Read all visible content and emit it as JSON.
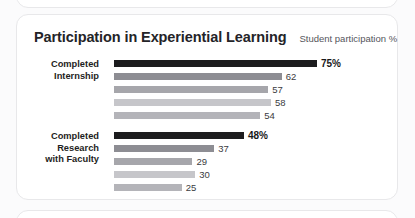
{
  "header": {
    "title": "Participation in Experiential Learning",
    "subtitle": "Student participation %"
  },
  "chart_data": {
    "type": "bar",
    "title": "Participation in Experiential Learning",
    "subtitle": "Student participation %",
    "orientation": "horizontal",
    "xlabel": "",
    "ylabel": "",
    "xlim": [
      0,
      80
    ],
    "grid": false,
    "legend": false,
    "value_unit": "%",
    "groups": [
      {
        "label_lines": [
          "Completed",
          "Internship"
        ],
        "bars": [
          {
            "value": 75,
            "label": "75%",
            "color": "#1c1c1e",
            "highlight": true
          },
          {
            "value": 62,
            "label": "62",
            "color": "#8d8d93",
            "highlight": false
          },
          {
            "value": 57,
            "label": "57",
            "color": "#a6a6ab",
            "highlight": false
          },
          {
            "value": 58,
            "label": "58",
            "color": "#c6c6ca",
            "highlight": false
          },
          {
            "value": 54,
            "label": "54",
            "color": "#b4b4b9",
            "highlight": false
          }
        ]
      },
      {
        "label_lines": [
          "Completed",
          "Research",
          "with Faculty"
        ],
        "bars": [
          {
            "value": 48,
            "label": "48%",
            "color": "#1c1c1e",
            "highlight": true
          },
          {
            "value": 37,
            "label": "37",
            "color": "#8d8d93",
            "highlight": false
          },
          {
            "value": 29,
            "label": "29",
            "color": "#a6a6ab",
            "highlight": false
          },
          {
            "value": 30,
            "label": "30",
            "color": "#c6c6ca",
            "highlight": false
          },
          {
            "value": 25,
            "label": "25",
            "color": "#b4b4b9",
            "highlight": false
          }
        ]
      }
    ]
  }
}
